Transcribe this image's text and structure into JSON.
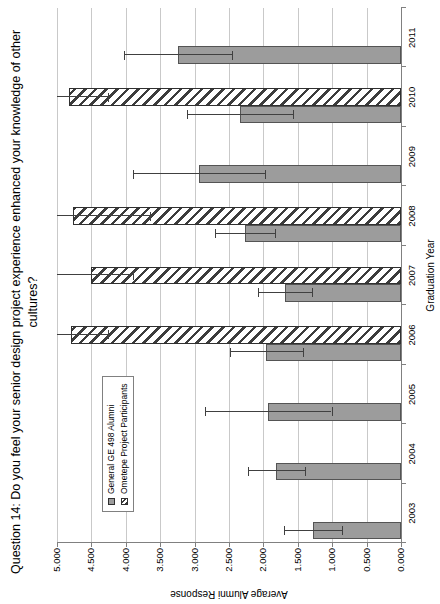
{
  "title": "Question 14: Do you feel your senior design project experience enhanced your knowledge of other cultures?",
  "chart_data": {
    "type": "bar",
    "note": "vertical grouped bar chart with error bars; whole image rotated 90 degrees counter-clockwise",
    "categories": [
      "2003",
      "2004",
      "2005",
      "2006",
      "2007",
      "2008",
      "2009",
      "2010",
      "2011"
    ],
    "series": [
      {
        "name": "General GE 498 Alumni",
        "style": "solid-gray",
        "values": [
          1.28,
          1.81,
          1.93,
          1.96,
          1.69,
          2.27,
          2.93,
          2.34,
          3.24
        ],
        "errors": [
          0.42,
          0.42,
          0.92,
          0.53,
          0.39,
          0.44,
          0.96,
          0.77,
          0.78
        ]
      },
      {
        "name": "Ometepe Project Participants",
        "style": "hatched",
        "values": [
          null,
          null,
          null,
          4.79,
          4.5,
          4.77,
          null,
          4.82,
          null
        ],
        "errors": [
          null,
          null,
          null,
          0.53,
          0.6,
          1.12,
          null,
          0.56,
          null
        ]
      }
    ],
    "xlabel": "Graduation Year",
    "ylabel": "Average Alumni Response",
    "ylim": [
      0,
      5
    ],
    "ytick_step": 0.5,
    "ytick_labels": [
      "0.000",
      "0.500",
      "1.000",
      "1.500",
      "2.000",
      "2.500",
      "3.000",
      "3.500",
      "4.000",
      "4.500",
      "5.000"
    ],
    "grid": true,
    "legend_position": "inside-plot-left",
    "error_bars_clipped_at_ymax": true
  },
  "colors": {
    "bar_fill": "#9c9c9c",
    "bar_border": "#545454",
    "hatch_stripe": "#3c3c3c",
    "hatch_bg": "#ffffff",
    "gridline": "#c9c9c9",
    "axis": "#808080",
    "error_bar": "#404040",
    "background": "#ffffff",
    "text": "#000000"
  }
}
